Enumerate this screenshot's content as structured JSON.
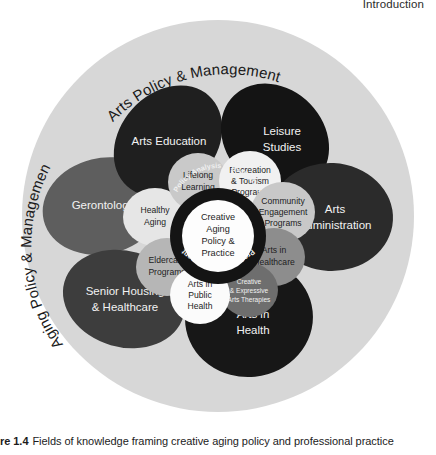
{
  "page": {
    "running_head": "Introduction"
  },
  "caption": {
    "figure_number": "re 1.4",
    "text": "Fields of knowledge framing creative aging policy and professional practice"
  },
  "diagram": {
    "title": "Fields of knowledge framing creative aging policy and professional practice",
    "background_circle_color": "#d7d7d7",
    "outer_labels": [
      {
        "id": "arts-policy-management",
        "label": "Arts Policy & Management",
        "position": "top",
        "color": "#1a1a1a"
      },
      {
        "id": "aging-policy-management",
        "label": "Aging Policy & Management",
        "position": "left",
        "color": "#1a1a1a"
      },
      {
        "id": "health-policy-management",
        "label": "Health Policy & Management",
        "position": "bottom-right",
        "color": "#1a1a1a"
      }
    ],
    "petals": [
      {
        "id": "arts-education",
        "label": "Arts Education",
        "fill": "#1f1f1f",
        "text_color": "#f2f2f2"
      },
      {
        "id": "leisure-studies",
        "label": "Leisure Studies",
        "lines": [
          "Leisure",
          "Studies"
        ],
        "fill": "#141414",
        "text_color": "#f2f2f2"
      },
      {
        "id": "arts-administration",
        "label": "Arts Administration",
        "lines": [
          "Arts",
          "Administration"
        ],
        "fill": "#2b2b2b",
        "text_color": "#f2f2f2"
      },
      {
        "id": "arts-in-health",
        "label": "Arts in Health",
        "lines": [
          "Arts in",
          "Health"
        ],
        "fill": "#171717",
        "text_color": "#f2f2f2"
      },
      {
        "id": "senior-housing-healthcare",
        "label": "Senior Housing & Healthcare",
        "lines": [
          "Senior Housing",
          "& Healthcare"
        ],
        "fill": "#3d3d3d",
        "text_color": "#f2f2f2"
      },
      {
        "id": "gerontology",
        "label": "Gerontology",
        "fill": "#5e5e5e",
        "text_color": "#f2f2f2"
      }
    ],
    "inner_circles": [
      {
        "id": "lifelong-learning",
        "label": "Lifelong Learning",
        "lines": [
          "Lifelong",
          "Learning"
        ],
        "fill": "#c9c9c9",
        "text_color": "#1d1d1d"
      },
      {
        "id": "recreation-tourism-programs",
        "label": "Recreation & Tourism Programs",
        "lines": [
          "Recreation",
          "& Tourism",
          "Programs"
        ],
        "fill": "#f1f1f1",
        "text_color": "#1d1d1d"
      },
      {
        "id": "community-engagement-programs",
        "label": "Community Engagement Programs",
        "lines": [
          "Community",
          "Engagement",
          "Programs"
        ],
        "fill": "#c8c8c8",
        "text_color": "#1d1d1d"
      },
      {
        "id": "arts-in-healthcare",
        "label": "Arts in Healthcare",
        "lines": [
          "Arts in",
          "Healthcare"
        ],
        "fill": "#8d8d8d",
        "text_color": "#1d1d1d"
      },
      {
        "id": "creative-expressive-arts-therapies",
        "label": "Creative & Expressive Arts Therapies",
        "lines": [
          "Creative",
          "& Expressive",
          "Arts Therapies"
        ],
        "fill": "#6e6e6e",
        "text_color": "#f2f2f2"
      },
      {
        "id": "arts-in-public-health",
        "label": "Arts in Public Health",
        "lines": [
          "Arts in",
          "Public",
          "Health"
        ],
        "fill": "#fbfbfb",
        "text_color": "#1d1d1d"
      },
      {
        "id": "eldercare-programs",
        "label": "Eldercare Programs",
        "lines": [
          "Eldercare",
          "Programs"
        ],
        "fill": "#b6b6b6",
        "text_color": "#1d1d1d"
      },
      {
        "id": "healthy-aging",
        "label": "Healthy Aging",
        "lines": [
          "Healthy",
          "Aging"
        ],
        "fill": "#e6e6e6",
        "text_color": "#1d1d1d"
      }
    ],
    "core": {
      "ring_fill": "#141414",
      "ring_text_color": "#f0f0f0",
      "ring_top_label": "Policy Analysis & Evaluation",
      "ring_bottom_label": "Program Management",
      "center_fill": "#fdfdfd",
      "center_text_color": "#1d1d1d",
      "center_label": "Creative Aging Policy & Practice",
      "center_lines": [
        "Creative",
        "Aging",
        "Policy &",
        "Practice"
      ]
    }
  }
}
